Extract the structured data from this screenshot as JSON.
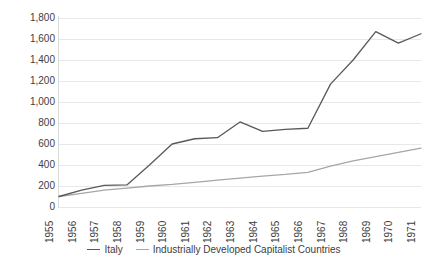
{
  "chart_data": {
    "type": "line",
    "title": "",
    "xlabel": "",
    "ylabel": "",
    "x": [
      1955,
      1956,
      1957,
      1958,
      1959,
      1960,
      1961,
      1962,
      1963,
      1964,
      1965,
      1966,
      1967,
      1968,
      1969,
      1970,
      1971
    ],
    "categories": [
      "1955",
      "1956",
      "1957",
      "1958",
      "1959",
      "1960",
      "1961",
      "1962",
      "1963",
      "1964",
      "1965",
      "1966",
      "1967",
      "1968",
      "1969",
      "1970",
      "1971"
    ],
    "series": [
      {
        "name": "Italy",
        "color": "#595959",
        "values": [
          100,
          160,
          205,
          210,
          400,
          600,
          650,
          660,
          810,
          720,
          740,
          750,
          1170,
          1400,
          1670,
          1560,
          1650
        ]
      },
      {
        "name": "Industrially Developed Capitalist Countries",
        "color": "#a6a6a6",
        "values": [
          100,
          130,
          160,
          180,
          200,
          215,
          235,
          255,
          275,
          295,
          310,
          330,
          390,
          440,
          480,
          520,
          560
        ]
      }
    ],
    "ylim": [
      0,
      1800
    ],
    "yticks": [
      "0",
      "200",
      "400",
      "600",
      "800",
      "1,000",
      "1,200",
      "1,400",
      "1,600",
      "1,800"
    ],
    "ytick_values": [
      0,
      200,
      400,
      600,
      800,
      1000,
      1200,
      1400,
      1600,
      1800
    ],
    "xlim": [
      1955,
      1971
    ],
    "grid": "horizontal",
    "legend_position": "bottom",
    "background_color": "#ffffff",
    "gridline_color": "#e8e8e8"
  },
  "legend": {
    "items": [
      {
        "label": "Italy"
      },
      {
        "label": "Industrially Developed Capitalist Countries"
      }
    ]
  }
}
